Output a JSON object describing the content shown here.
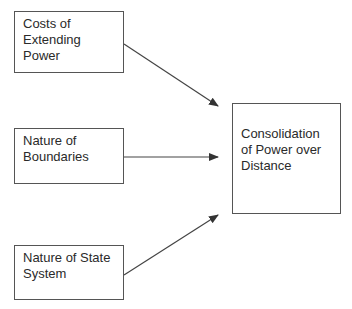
{
  "diagram": {
    "inputs": [
      {
        "label": "Costs of\nExtending\nPower"
      },
      {
        "label": "Nature of\nBoundaries"
      },
      {
        "label": "Nature of State\nSystem"
      }
    ],
    "output": {
      "label": "Consolidation\nof Power over\nDistance"
    },
    "edges": [
      {
        "from": "Costs of Extending Power",
        "to": "Consolidation of Power over Distance"
      },
      {
        "from": "Nature of Boundaries",
        "to": "Consolidation of Power over Distance"
      },
      {
        "from": "Nature of State System",
        "to": "Consolidation of Power over Distance"
      }
    ]
  }
}
